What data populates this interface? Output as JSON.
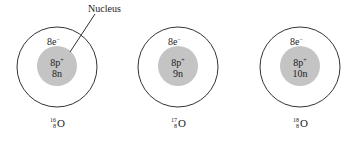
{
  "diagram": {
    "callout_label": "Nucleus",
    "colors": {
      "nucleus_fill": "#c4c4c4",
      "shell_stroke": "#333333",
      "background": "#ffffff"
    },
    "atoms": [
      {
        "electrons": "8e",
        "electron_sign": "−",
        "protons": "8p",
        "proton_sign": "+",
        "neutrons": "8n",
        "mass_number": "16",
        "atomic_number": "8",
        "symbol": "O"
      },
      {
        "electrons": "8e",
        "electron_sign": "−",
        "protons": "8p",
        "proton_sign": "+",
        "neutrons": "9n",
        "mass_number": "17",
        "atomic_number": "8",
        "symbol": "O"
      },
      {
        "electrons": "8e",
        "electron_sign": "−",
        "protons": "8p",
        "proton_sign": "+",
        "neutrons": "10n",
        "mass_number": "18",
        "atomic_number": "8",
        "symbol": "O"
      }
    ]
  }
}
